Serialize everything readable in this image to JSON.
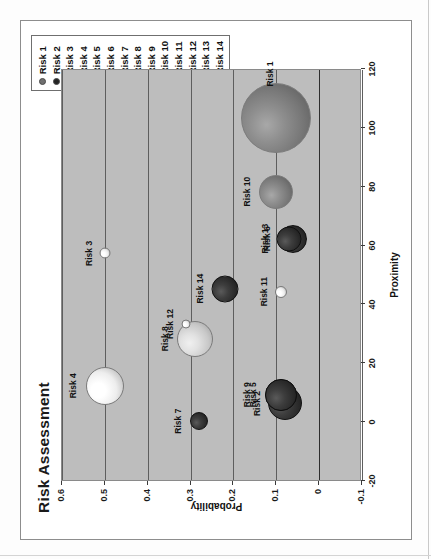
{
  "chart_frame": {
    "title": "Risk Assessment",
    "rotation_degrees": -90,
    "plot_background_color": "#bdbdbd"
  },
  "legend": {
    "position": "top-right",
    "items": [
      {
        "label": "Risk 1",
        "marker": "filled-circle",
        "color": "#707070"
      },
      {
        "label": "Risk 2",
        "marker": "filled-circle",
        "color": "#242424"
      },
      {
        "label": "Risk 3",
        "marker": "open-circle",
        "color": "#ffffff"
      },
      {
        "label": "Risk 4",
        "marker": "open-circle",
        "color": "#ffffff"
      },
      {
        "label": "Risk 5",
        "marker": "filled-circle",
        "color": "#242424"
      },
      {
        "label": "Risk 6",
        "marker": "filled-circle",
        "color": "#6e6e6e"
      },
      {
        "label": "Risk 7",
        "marker": "filled-circle",
        "color": "#3a3a3a"
      },
      {
        "label": "Risk 8",
        "marker": "open-circle",
        "color": "#ffffff"
      },
      {
        "label": "Risk 9",
        "marker": "filled-circle",
        "color": "#1c1c1c"
      },
      {
        "label": "Risk 10",
        "marker": "filled-circle",
        "color": "#6e6e6e"
      },
      {
        "label": "Risk 11",
        "marker": "open-circle",
        "color": "#ffffff"
      },
      {
        "label": "Risk 12",
        "marker": "open-circle",
        "color": "#ffffff"
      },
      {
        "label": "Risk 13",
        "marker": "filled-circle",
        "color": "#2b2b2b"
      },
      {
        "label": "Risk 14",
        "marker": "filled-circle",
        "color": "#2b2b2b"
      }
    ]
  },
  "chart_data": {
    "type": "scatter",
    "subtype": "bubble",
    "title": "Risk Assessment",
    "xlabel": "Proximity",
    "ylabel": "Probability",
    "xlim": [
      -20,
      120
    ],
    "ylim": [
      -0.1,
      0.6
    ],
    "xticks": [
      -20,
      0,
      20,
      40,
      60,
      80,
      100,
      120
    ],
    "xtick_labels": [
      "-20",
      "0",
      "20",
      "40",
      "60",
      "80",
      "100",
      "120"
    ],
    "yticks": [
      -0.1,
      0,
      0.1,
      0.2,
      0.3,
      0.4,
      0.5,
      0.6
    ],
    "ytick_labels": [
      "-0.1",
      "0",
      "0.1",
      "0.2",
      "0.3",
      "0.4",
      "0.5",
      "0.6"
    ],
    "grid": "horizontal",
    "legend_position": "top-right",
    "points": [
      {
        "name": "Risk 1",
        "x": 103,
        "y": 0.1,
        "size": 70,
        "color": "#6f6f6f",
        "style": "sphere-gray",
        "label_dx": 44,
        "label_dy": -6
      },
      {
        "name": "Risk 2",
        "x": 6,
        "y": 0.08,
        "size": 34,
        "color": "#1f1f1f",
        "style": "sphere-dark",
        "label_dx": 0,
        "label_dy": -28
      },
      {
        "name": "Risk 3",
        "x": 57,
        "y": 0.5,
        "size": 11,
        "color": "#f2f2f2",
        "style": "sphere-white",
        "label_dx": 0,
        "label_dy": -16
      },
      {
        "name": "Risk 4",
        "x": 12,
        "y": 0.5,
        "size": 38,
        "color": "#f5f5f5",
        "style": "sphere-white",
        "label_dx": 0,
        "label_dy": -32
      },
      {
        "name": "Risk 5",
        "x": 9,
        "y": 0.09,
        "size": 32,
        "color": "#1c1c1c",
        "style": "sphere-dark",
        "label_dx": 0,
        "label_dy": -28
      },
      {
        "name": "Risk 6",
        "x": 62,
        "y": 0.06,
        "size": 28,
        "color": "#3a3a3a",
        "style": "sphere-dark",
        "label_dx": 0,
        "label_dy": -26
      },
      {
        "name": "Risk 7",
        "x": 0,
        "y": 0.28,
        "size": 18,
        "color": "#4a4a4a",
        "style": "sphere-dark",
        "label_dx": 0,
        "label_dy": -21
      },
      {
        "name": "Risk 8",
        "x": 28,
        "y": 0.29,
        "size": 36,
        "color": "#d2d2d2",
        "style": "sphere-light",
        "label_dx": 0,
        "label_dy": -30
      },
      {
        "name": "Risk 9",
        "x": 9,
        "y": 0.09,
        "size": 32,
        "color": "#1c1c1c",
        "style": "sphere-dark",
        "label_dx": 0,
        "label_dy": -34
      },
      {
        "name": "Risk 10",
        "x": 78,
        "y": 0.1,
        "size": 34,
        "color": "#767676",
        "style": "sphere-gray",
        "label_dx": 0,
        "label_dy": -29
      },
      {
        "name": "Risk 11",
        "x": 44,
        "y": 0.09,
        "size": 12,
        "color": "#f0f0f0",
        "style": "sphere-white",
        "label_dx": 0,
        "label_dy": -17
      },
      {
        "name": "Risk 12",
        "x": 33,
        "y": 0.31,
        "size": 9,
        "color": "#f4f4f4",
        "style": "sphere-white",
        "label_dx": 0,
        "label_dy": -16
      },
      {
        "name": "Risk 13",
        "x": 62,
        "y": 0.07,
        "size": 25,
        "color": "#262626",
        "style": "sphere-dark",
        "label_dx": 0,
        "label_dy": -24
      },
      {
        "name": "Risk 14",
        "x": 45,
        "y": 0.22,
        "size": 27,
        "color": "#303030",
        "style": "sphere-dark",
        "label_dx": 0,
        "label_dy": -25
      }
    ]
  }
}
